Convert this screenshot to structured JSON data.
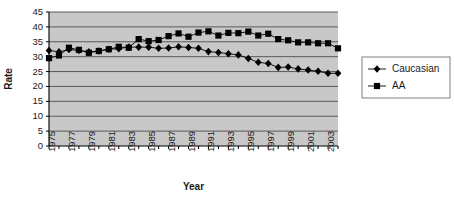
{
  "chart_data": {
    "type": "line",
    "title": "",
    "xlabel": "Year",
    "ylabel": "Rate",
    "ylim": [
      0,
      45
    ],
    "ytick_step": 5,
    "yticks": [
      0,
      5,
      10,
      15,
      20,
      25,
      30,
      35,
      40,
      45
    ],
    "xlim": [
      1975,
      2004
    ],
    "xticks_all": [
      1975,
      1976,
      1977,
      1978,
      1979,
      1980,
      1981,
      1982,
      1983,
      1984,
      1985,
      1986,
      1987,
      1988,
      1989,
      1990,
      1991,
      1992,
      1993,
      1994,
      1995,
      1996,
      1997,
      1998,
      1999,
      2000,
      2001,
      2002,
      2003,
      2004
    ],
    "xtick_labels": [
      "1975",
      "",
      "1977",
      "",
      "1979",
      "",
      "1981",
      "",
      "1983",
      "",
      "1985",
      "",
      "1987",
      "",
      "1989",
      "",
      "1991",
      "",
      "1993",
      "",
      "1995",
      "",
      "1997",
      "",
      "1999",
      "",
      "2001",
      "",
      "2003",
      ""
    ],
    "grid": "horizontal",
    "plot_background": "#c8c8c8",
    "legend_position": "right",
    "x": [
      1975,
      1976,
      1977,
      1978,
      1979,
      1980,
      1981,
      1982,
      1983,
      1984,
      1985,
      1986,
      1987,
      1988,
      1989,
      1990,
      1991,
      1992,
      1993,
      1994,
      1995,
      1996,
      1997,
      1998,
      1999,
      2000,
      2001,
      2002,
      2003,
      2004
    ],
    "series": [
      {
        "name": "Caucasian",
        "marker": "diamond",
        "color": "#000000",
        "values": [
          32.1,
          31.6,
          32.4,
          32.1,
          31.6,
          31.9,
          32.5,
          32.7,
          33.2,
          33.2,
          33.2,
          32.8,
          32.9,
          33.3,
          33.1,
          32.8,
          31.7,
          31.4,
          31.0,
          30.6,
          29.4,
          28.1,
          27.7,
          26.4,
          26.5,
          25.9,
          25.5,
          25.1,
          24.4,
          24.4
        ]
      },
      {
        "name": "AA",
        "marker": "square",
        "color": "#000000",
        "values": [
          29.5,
          30.4,
          33.0,
          32.3,
          31.3,
          31.9,
          32.5,
          33.3,
          33.0,
          35.9,
          35.2,
          35.6,
          36.9,
          37.8,
          36.7,
          38.1,
          38.5,
          37.1,
          38.0,
          37.9,
          38.4,
          37.1,
          37.7,
          35.9,
          35.5,
          34.8,
          34.8,
          34.5,
          34.5,
          32.8
        ]
      }
    ]
  },
  "legend": {
    "items": [
      {
        "label": "Caucasian",
        "marker": "diamond"
      },
      {
        "label": "AA",
        "marker": "square"
      }
    ]
  }
}
